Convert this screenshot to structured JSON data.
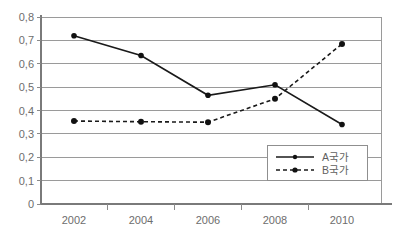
{
  "chart_data": {
    "type": "line",
    "title": "",
    "xlabel": "",
    "ylabel": "",
    "categories": [
      "2002",
      "2004",
      "2006",
      "2008",
      "2010"
    ],
    "ylim": [
      0,
      0.8
    ],
    "ytick_labels": [
      "0,8",
      "0,7",
      "0,6",
      "0,5",
      "0,4",
      "0,3",
      "0,2",
      "0,1",
      "0"
    ],
    "ytick_values": [
      0.8,
      0.7,
      0.6,
      0.5,
      0.4,
      0.3,
      0.2,
      0.1,
      0
    ],
    "grid": true,
    "legend_position": "bottom-right",
    "decimal_separator": ",",
    "series": [
      {
        "name": "A국가",
        "style": "solid",
        "marker": "filled-circle",
        "color": "#1a1a1a",
        "values": [
          0.72,
          0.635,
          0.465,
          0.51,
          0.34
        ]
      },
      {
        "name": "B국가",
        "style": "dashed",
        "marker": "filled-circle",
        "color": "#1a1a1a",
        "values": [
          0.355,
          0.352,
          0.35,
          0.45,
          0.685
        ]
      }
    ]
  },
  "legend": {
    "items": [
      {
        "label": "A국가",
        "style": "solid"
      },
      {
        "label": "B국가",
        "style": "dashed"
      }
    ]
  },
  "axes": {
    "y_labels": [
      "0,8",
      "0,7",
      "0,6",
      "0,5",
      "0,4",
      "0,3",
      "0,2",
      "0,1",
      "0"
    ],
    "x_labels": [
      "2002",
      "2004",
      "2006",
      "2008",
      "2010"
    ]
  }
}
